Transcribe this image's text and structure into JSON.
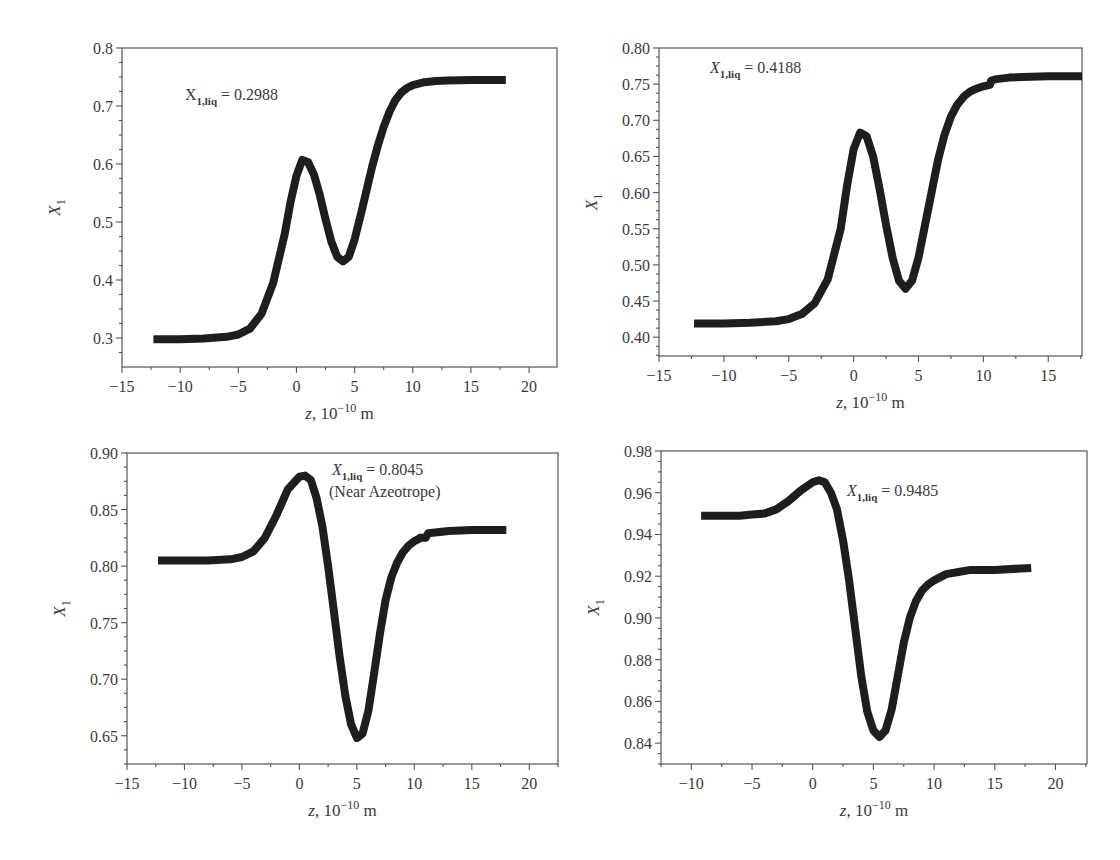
{
  "figure": {
    "panel_count": 4
  },
  "chart_data": [
    {
      "type": "line",
      "title": "",
      "annotation": {
        "symbol": "X",
        "subscript": "1,liq",
        "text": " = 0.2988",
        "italic": false
      },
      "xlabel": "z, 10^-10 m",
      "ylabel": "X1",
      "xlim": [
        -15,
        22.4
      ],
      "ylim": [
        0.25,
        0.8
      ],
      "xticks": [
        -15,
        -10,
        -5,
        0,
        5,
        10,
        15,
        20
      ],
      "xtick_labels": [
        "−15",
        "−10",
        "−5",
        "0",
        "5",
        "10",
        "15",
        "20"
      ],
      "yticks": [
        0.3,
        0.4,
        0.5,
        0.6,
        0.7,
        0.8
      ],
      "ytick_labels": [
        "0.3",
        "0.4",
        "0.5",
        "0.6",
        "0.7",
        "0.8"
      ],
      "grid": false,
      "series": [
        {
          "name": "X1 profile",
          "x": [
            -12.3,
            -10,
            -8,
            -6,
            -5,
            -4,
            -3,
            -2,
            -1,
            -0.5,
            0,
            0.5,
            1,
            1.5,
            2,
            2.5,
            3,
            3.5,
            4,
            4.5,
            5,
            5.5,
            6,
            6.5,
            7,
            7.5,
            8,
            8.5,
            9,
            9.5,
            10,
            11,
            12,
            13,
            15,
            18
          ],
          "y": [
            0.298,
            0.298,
            0.299,
            0.302,
            0.306,
            0.316,
            0.342,
            0.395,
            0.48,
            0.535,
            0.58,
            0.607,
            0.603,
            0.582,
            0.547,
            0.505,
            0.466,
            0.44,
            0.432,
            0.44,
            0.47,
            0.51,
            0.553,
            0.595,
            0.632,
            0.664,
            0.69,
            0.71,
            0.723,
            0.731,
            0.736,
            0.741,
            0.743,
            0.744,
            0.745,
            0.745
          ]
        }
      ],
      "box_px": {
        "left": 122,
        "top": 48,
        "right": 557,
        "bottom": 367
      }
    },
    {
      "type": "line",
      "title": "",
      "annotation": {
        "symbol": "X",
        "subscript": "1,liq",
        "text": " = 0.4188",
        "italic": true
      },
      "xlabel": "z, 10^-10 m",
      "ylabel": "X1",
      "xlim": [
        -15,
        17.6
      ],
      "ylim": [
        0.374,
        0.8
      ],
      "xticks": [
        -15,
        -10,
        -5,
        0,
        5,
        10,
        15
      ],
      "xtick_labels": [
        "−15",
        "−10",
        "−5",
        "0",
        "5",
        "10",
        "15"
      ],
      "yticks": [
        0.4,
        0.45,
        0.5,
        0.55,
        0.6,
        0.65,
        0.7,
        0.75,
        0.8
      ],
      "ytick_labels": [
        "0.40",
        "0.45",
        "0.50",
        "0.55",
        "0.60",
        "0.65",
        "0.70",
        "0.75",
        "0.80"
      ],
      "grid": false,
      "series": [
        {
          "name": "X1 profile",
          "x": [
            -12.3,
            -10,
            -8,
            -6,
            -5,
            -4,
            -3,
            -2,
            -1,
            -0.5,
            0,
            0.5,
            1,
            1.5,
            2,
            2.5,
            3,
            3.5,
            4,
            4.5,
            5,
            5.5,
            6,
            6.5,
            7,
            7.5,
            8,
            8.5,
            9,
            9.5,
            10,
            10.5,
            10.6,
            11,
            12,
            13,
            15,
            17.6
          ],
          "y": [
            0.419,
            0.419,
            0.42,
            0.422,
            0.425,
            0.432,
            0.447,
            0.48,
            0.55,
            0.61,
            0.66,
            0.683,
            0.678,
            0.65,
            0.605,
            0.555,
            0.51,
            0.478,
            0.467,
            0.478,
            0.51,
            0.555,
            0.6,
            0.645,
            0.68,
            0.705,
            0.722,
            0.733,
            0.74,
            0.744,
            0.747,
            0.749,
            0.755,
            0.757,
            0.759,
            0.76,
            0.761,
            0.761
          ]
        }
      ],
      "box_px": {
        "left": 659,
        "top": 48,
        "right": 1082,
        "bottom": 356
      }
    },
    {
      "type": "line",
      "title": "",
      "annotation": {
        "symbol": "X",
        "subscript": "1,liq",
        "text": " = 0.8045",
        "line2": "(Near Azeotrope)",
        "italic": true
      },
      "xlabel": "z, 10^-10 m",
      "ylabel": "X1",
      "xlim": [
        -15,
        22.5
      ],
      "ylim": [
        0.625,
        0.9
      ],
      "xticks": [
        -15,
        -10,
        -5,
        0,
        5,
        10,
        15,
        20
      ],
      "xtick_labels": [
        "−15",
        "−10",
        "−5",
        "0",
        "5",
        "10",
        "15",
        "20"
      ],
      "yticks": [
        0.65,
        0.7,
        0.75,
        0.8,
        0.85,
        0.9
      ],
      "ytick_labels": [
        "0.65",
        "0.70",
        "0.75",
        "0.80",
        "0.85",
        "0.90"
      ],
      "grid": false,
      "series": [
        {
          "name": "X1 profile",
          "x": [
            -12.3,
            -10,
            -8,
            -6,
            -5,
            -4,
            -3,
            -2,
            -1,
            0,
            0.5,
            1,
            1.5,
            2,
            2.5,
            3,
            3.5,
            4,
            4.5,
            5,
            5.5,
            6,
            6.5,
            7,
            7.5,
            8,
            8.5,
            9,
            9.5,
            10,
            10.4,
            10.5,
            11,
            11.2,
            12,
            13,
            15,
            18
          ],
          "y": [
            0.805,
            0.805,
            0.805,
            0.806,
            0.808,
            0.813,
            0.825,
            0.845,
            0.868,
            0.879,
            0.88,
            0.876,
            0.86,
            0.835,
            0.8,
            0.76,
            0.72,
            0.685,
            0.66,
            0.648,
            0.652,
            0.672,
            0.705,
            0.74,
            0.77,
            0.79,
            0.803,
            0.812,
            0.818,
            0.822,
            0.824,
            0.825,
            0.825,
            0.829,
            0.83,
            0.831,
            0.832,
            0.832
          ]
        }
      ],
      "box_px": {
        "left": 127,
        "top": 453,
        "right": 558,
        "bottom": 764
      }
    },
    {
      "type": "line",
      "title": "",
      "annotation": {
        "symbol": "X",
        "subscript": "1,liq",
        "text": " = 0.9485",
        "italic": true
      },
      "xlabel": "z, 10^-10 m",
      "ylabel": "X1",
      "xlim": [
        -12.5,
        22.6
      ],
      "ylim": [
        0.83,
        0.98
      ],
      "xticks": [
        -10,
        -5,
        0,
        5,
        10,
        15,
        20
      ],
      "xtick_labels": [
        "−10",
        "−5",
        "0",
        "5",
        "10",
        "15",
        "20"
      ],
      "yticks": [
        0.84,
        0.86,
        0.88,
        0.9,
        0.92,
        0.94,
        0.96,
        0.98
      ],
      "ytick_labels": [
        "0.84",
        "0.86",
        "0.88",
        "0.90",
        "0.92",
        "0.94",
        "0.96",
        "0.98"
      ],
      "grid": false,
      "series": [
        {
          "name": "X1 profile",
          "x": [
            -9.2,
            -8,
            -6,
            -5,
            -4,
            -3,
            -2,
            -1,
            0,
            0.5,
            1,
            1.5,
            2,
            2.5,
            3,
            3.5,
            4,
            4.5,
            5,
            5.5,
            6,
            6.5,
            7,
            7.5,
            8,
            8.5,
            9,
            9.5,
            10,
            11,
            12,
            13,
            15,
            18
          ],
          "y": [
            0.949,
            0.949,
            0.949,
            0.9495,
            0.95,
            0.952,
            0.956,
            0.961,
            0.965,
            0.966,
            0.965,
            0.96,
            0.952,
            0.937,
            0.918,
            0.895,
            0.872,
            0.855,
            0.846,
            0.843,
            0.846,
            0.856,
            0.872,
            0.888,
            0.9,
            0.908,
            0.913,
            0.916,
            0.918,
            0.921,
            0.922,
            0.923,
            0.923,
            0.924
          ]
        }
      ],
      "box_px": {
        "left": 661,
        "top": 451,
        "right": 1087,
        "bottom": 764
      }
    }
  ]
}
